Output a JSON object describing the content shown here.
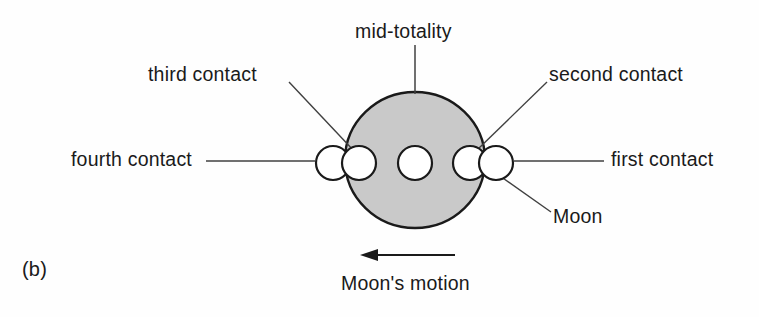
{
  "figure": {
    "panel_label": "(b)",
    "background_color": "#fefefe",
    "ink_color": "#1a1a1a",
    "sun_disk": {
      "name": "Sun",
      "fill_color": "#c9c9c9",
      "stroke_color": "#1a1a1a",
      "center_x": 415,
      "center_y": 160,
      "radius_x": 70,
      "radius_y": 68
    },
    "moon_positions": [
      {
        "id": "first-contact-moon",
        "label_ref": "first contact",
        "center_x": 496,
        "center_y": 163,
        "radius": 17
      },
      {
        "id": "second-contact-moon",
        "label_ref": "second contact",
        "center_x": 470,
        "center_y": 163,
        "radius": 17
      },
      {
        "id": "mid-totality-moon",
        "label_ref": "mid-totality",
        "center_x": 415,
        "center_y": 163,
        "radius": 17
      },
      {
        "id": "third-contact-moon",
        "label_ref": "third contact",
        "center_x": 359,
        "center_y": 163,
        "radius": 17
      },
      {
        "id": "fourth-contact-moon",
        "label_ref": "fourth contact",
        "center_x": 333,
        "center_y": 163,
        "radius": 17
      }
    ],
    "moon_fill_color": "#ffffff",
    "moon_stroke_color": "#1a1a1a"
  },
  "labels": {
    "mid_totality": "mid-totality",
    "third_contact": "third contact",
    "second_contact": "second contact",
    "fourth_contact": "fourth contact",
    "first_contact": "first contact",
    "moon": "Moon",
    "moons_motion": "Moon's motion",
    "panel_b": "(b)"
  },
  "annotations": {
    "motion_arrow": {
      "name": "moons-motion-arrow",
      "direction": "left",
      "from_x": 455,
      "from_y": 255,
      "to_x": 362,
      "to_y": 255
    },
    "leader_lines": [
      {
        "name": "mid-totality-leader",
        "x1": 415,
        "y1": 45,
        "x2": 415,
        "y2": 94
      },
      {
        "name": "third-contact-leader",
        "x1": 289,
        "y1": 82,
        "x2": 355,
        "y2": 152
      },
      {
        "name": "second-contact-leader",
        "x1": 547,
        "y1": 82,
        "x2": 477,
        "y2": 150
      },
      {
        "name": "fourth-contact-leader",
        "x1": 206,
        "y1": 161,
        "x2": 315,
        "y2": 161
      },
      {
        "name": "first-contact-leader",
        "x1": 513,
        "y1": 161,
        "x2": 604,
        "y2": 161
      },
      {
        "name": "moon-leader",
        "x1": 500,
        "y1": 175,
        "x2": 550,
        "y2": 211
      }
    ]
  }
}
